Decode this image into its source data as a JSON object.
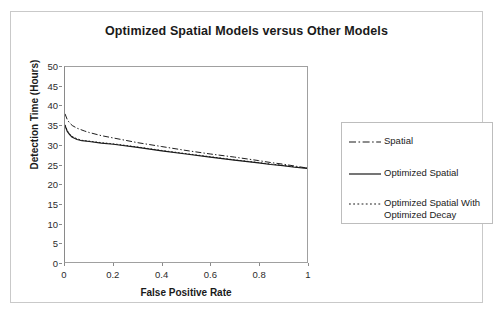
{
  "chart_data": {
    "type": "line",
    "title": "Optimized Spatial Models versus Other Models",
    "xlabel": "False Positive Rate",
    "ylabel": "Detection Time (Hours)",
    "xlim": [
      0,
      1
    ],
    "ylim": [
      0,
      50
    ],
    "xticks": [
      "0",
      "0.2",
      "0.4",
      "0.6",
      "0.8",
      "1"
    ],
    "xtick_values": [
      0,
      0.2,
      0.4,
      0.6,
      0.8,
      1
    ],
    "yticks": [
      "0",
      "5",
      "10",
      "15",
      "20",
      "25",
      "30",
      "35",
      "40",
      "45",
      "50"
    ],
    "ytick_values": [
      0,
      5,
      10,
      15,
      20,
      25,
      30,
      35,
      40,
      45,
      50
    ],
    "grid": false,
    "legend_position": "right",
    "series": [
      {
        "name": "Spatial",
        "style": "dash-dot",
        "color": "#1a1a1a",
        "x": [
          0,
          0.01,
          0.02,
          0.03,
          0.05,
          0.08,
          0.1,
          0.15,
          0.2,
          0.3,
          0.4,
          0.5,
          0.6,
          0.7,
          0.8,
          0.85,
          0.9,
          0.95,
          1
        ],
        "y": [
          38.0,
          36.4,
          35.6,
          35.0,
          34.3,
          33.6,
          33.2,
          32.4,
          31.8,
          30.6,
          29.6,
          28.6,
          27.7,
          26.9,
          26.0,
          25.5,
          25.1,
          24.6,
          24.1
        ]
      },
      {
        "name": "Optimized Spatial",
        "style": "solid",
        "color": "#1a1a1a",
        "x": [
          0,
          0.01,
          0.02,
          0.03,
          0.05,
          0.07,
          0.1,
          0.15,
          0.2,
          0.3,
          0.4,
          0.5,
          0.6,
          0.7,
          0.8,
          0.85,
          0.9,
          0.95,
          1
        ],
        "y": [
          35.0,
          33.4,
          32.6,
          32.0,
          31.4,
          31.1,
          30.9,
          30.5,
          30.2,
          29.4,
          28.5,
          27.7,
          26.9,
          26.1,
          25.4,
          25.0,
          24.7,
          24.3,
          24.0
        ]
      },
      {
        "name": "Optimized Spatial With Optimized Decay",
        "style": "dotted",
        "color": "#1a1a1a",
        "x": [
          0,
          0.01,
          0.02,
          0.03,
          0.05,
          0.07,
          0.1,
          0.15,
          0.2,
          0.3,
          0.4,
          0.5,
          0.6,
          0.7,
          0.8,
          0.85,
          0.9,
          0.95,
          1
        ],
        "y": [
          35.2,
          33.6,
          32.8,
          32.2,
          31.6,
          31.2,
          31.0,
          30.6,
          30.3,
          29.5,
          28.6,
          27.8,
          27.0,
          26.2,
          25.5,
          25.1,
          24.8,
          24.4,
          24.1
        ]
      }
    ]
  },
  "legend": {
    "entries": [
      {
        "label": "Spatial"
      },
      {
        "label": "Optimized Spatial"
      },
      {
        "label": "Optimized Spatial With Optimized Decay"
      }
    ]
  }
}
